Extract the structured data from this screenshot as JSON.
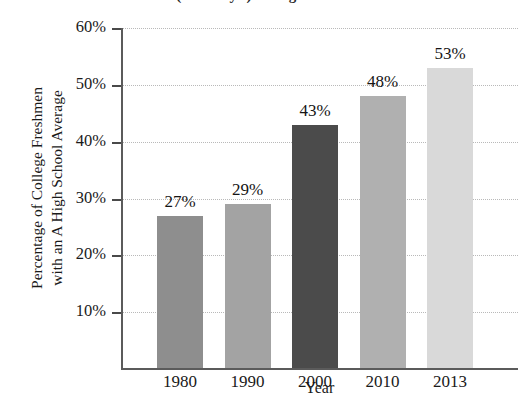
{
  "chart_data": {
    "type": "bar",
    "title": "(18 - 19 yr.) at High School",
    "title_clipped": true,
    "categories": [
      "1980",
      "1990",
      "2000",
      "2010",
      "2013"
    ],
    "values": [
      27,
      29,
      43,
      48,
      53
    ],
    "value_labels": [
      "27%",
      "29%",
      "43%",
      "48%",
      "53%"
    ],
    "xlabel": "Year",
    "ylabel": "Percentage of College Freshmen with an A High School Average",
    "ylabel_line1": "Percentage of College Freshmen",
    "ylabel_line2": "with an A High School Average",
    "ylim": [
      0,
      60
    ],
    "ytick_values": [
      60,
      50,
      40,
      30,
      20,
      10
    ],
    "ytick_labels": [
      "60%",
      "50%",
      "40%",
      "30%",
      "20%",
      "10%"
    ],
    "grid": true,
    "grid_style": "dotted",
    "legend": "none",
    "bar_colors": [
      "#8e8e8e",
      "#a3a3a3",
      "#4b4b4b",
      "#b0b0b0",
      "#d9d9d9"
    ],
    "axis_color": "#5b5b5b",
    "grid_color": "#b9b9b9",
    "background_color": "#ffffff"
  }
}
